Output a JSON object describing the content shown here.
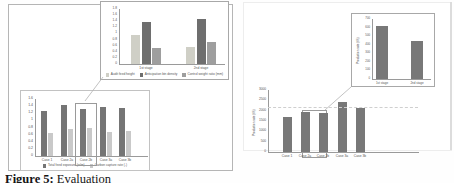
{
  "caption": {
    "label": "Figure 5:",
    "text": " Evaluation"
  },
  "colors": {
    "frame": "#b5b5b5",
    "axis": "#9a9a9a",
    "callout": "#b3b3b3",
    "bar_dark": "#757575",
    "bar_light": "#cccccc",
    "bar_mid": "#a3a3a3"
  },
  "chart_data": [
    {
      "id": "left-main",
      "type": "bar",
      "categories": [
        "Case 1",
        "Case 2a",
        "Case 2b",
        "Case 3a",
        "Case 3b"
      ],
      "series": [
        {
          "name": "Total feed exposure (w/m)",
          "color": "#757575",
          "values": [
            1.26,
            1.43,
            1.32,
            1.38,
            1.35
          ]
        },
        {
          "name": "Carbon capture rate (-)",
          "color": "#c9c9c9",
          "values": [
            0.65,
            0.75,
            0.78,
            0.67,
            0.7
          ]
        }
      ],
      "ylim": [
        0,
        1.6
      ],
      "ytick_step": 0.2,
      "grid": false,
      "legend_position": "bottom",
      "highlight_category": "Case 2b"
    },
    {
      "id": "left-inset",
      "type": "bar",
      "categories": [
        "1st stage",
        "2nd stage"
      ],
      "series": [
        {
          "name": "Audit feed height",
          "color": "#cfcfc6",
          "values": [
            0.95,
            0.57
          ]
        },
        {
          "name": "Anticipation bin density",
          "color": "#6e6e6e",
          "values": [
            1.36,
            1.48
          ]
        },
        {
          "name": "Control weight ratio (mm)",
          "color": "#9e9e9e",
          "values": [
            0.54,
            0.73
          ]
        }
      ],
      "ylim": [
        0,
        1.8
      ],
      "ytick_step": 0.2,
      "grid": false,
      "legend_position": "bottom"
    },
    {
      "id": "right-main",
      "type": "bar",
      "categories": [
        "Case 1",
        "Case 2a",
        "Case 2b",
        "Case 3a",
        "Case 3b"
      ],
      "series": [
        {
          "name": "",
          "color": "#787878",
          "values": [
            1700,
            1930,
            1890,
            2420,
            2130
          ]
        }
      ],
      "ylim": [
        0,
        3000
      ],
      "ytick_step": 500,
      "grid": false,
      "ylabel": "Production rate (t/h)",
      "dashed_gridline": 2200,
      "highlight_category": "Case 2b"
    },
    {
      "id": "right-inset",
      "type": "bar",
      "categories": [
        "1st stage",
        "2nd stage"
      ],
      "series": [
        {
          "name": "",
          "color": "#787878",
          "values": [
            620,
            445
          ]
        }
      ],
      "ylim": [
        0,
        700
      ],
      "ytick_step": 100,
      "grid": false,
      "ylabel": "Production rate (t/h)"
    }
  ]
}
